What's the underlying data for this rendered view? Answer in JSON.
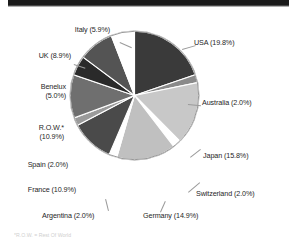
{
  "header": {
    "band_color": "#1a1a1a"
  },
  "footnote": {
    "text": "*R.O.W. = Rest Of World"
  },
  "chart_data": {
    "type": "pie",
    "title": "",
    "subtitle": "",
    "xlabel": "",
    "ylabel": "",
    "grid": false,
    "legend_position": "none",
    "labels_outside": true,
    "start_angle_deg": 0,
    "direction": "clockwise",
    "total_percent": 100.0,
    "categories": [
      "USA",
      "Australia",
      "Japan",
      "Switzerland",
      "Germany",
      "Argentina",
      "France",
      "Spain",
      "R.O.W.*",
      "Benelux",
      "UK",
      "Italy"
    ],
    "values": [
      19.8,
      2.0,
      15.8,
      2.0,
      14.9,
      2.0,
      10.9,
      2.0,
      10.9,
      5.0,
      8.9,
      5.9
    ],
    "slice_colors": [
      "#3a3a3a",
      "#8a8a8a",
      "#c8c8c8",
      "#ffffff",
      "#c0c0c0",
      "#ffffff",
      "#4a4a4a",
      "#9a9a9a",
      "#6f6f6f",
      "#2a2a2a",
      "#545454",
      "#ffffff"
    ],
    "slices": [
      {
        "label": "USA (19.8%)",
        "name": "USA",
        "percent": 19.8,
        "color": "#3a3a3a"
      },
      {
        "label": "Australia (2.0%)",
        "name": "Australia",
        "percent": 2.0,
        "color": "#8a8a8a"
      },
      {
        "label": "Japan (15.8%)",
        "name": "Japan",
        "percent": 15.8,
        "color": "#c8c8c8"
      },
      {
        "label": "Switzerland (2.0%)",
        "name": "Switzerland",
        "percent": 2.0,
        "color": "#ffffff"
      },
      {
        "label": "Germany (14.9%)",
        "name": "Germany",
        "percent": 14.9,
        "color": "#c0c0c0"
      },
      {
        "label": "Argentina (2.0%)",
        "name": "Argentina",
        "percent": 2.0,
        "color": "#ffffff"
      },
      {
        "label": "France (10.9%)",
        "name": "France",
        "percent": 10.9,
        "color": "#4a4a4a"
      },
      {
        "label": "Spain (2.0%)",
        "name": "Spain",
        "percent": 2.0,
        "color": "#9a9a9a"
      },
      {
        "label": "R.O.W.* (10.9%)",
        "name": "R.O.W.*",
        "percent": 10.9,
        "color": "#6f6f6f"
      },
      {
        "label": "Benelux (5.0%)",
        "name": "Benelux",
        "percent": 5.0,
        "color": "#2a2a2a"
      },
      {
        "label": "UK (8.9%)",
        "name": "UK",
        "percent": 8.9,
        "color": "#545454"
      },
      {
        "label": "Italy (5.9%)",
        "name": "Italy",
        "percent": 5.9,
        "color": "#ffffff"
      }
    ]
  },
  "labels": {
    "italy": "Italy (5.9%)",
    "uk": "UK (8.9%)",
    "benelux_line1": "Benelux",
    "benelux_line2": "(5.0%)",
    "row_line1": "R.O.W.*",
    "row_line2": "(10.9%)",
    "spain": "Spain (2.0%)",
    "france": "France (10.9%)",
    "argentina": "Argentina (2.0%)",
    "germany": "Germany (14.9%)",
    "switzerland": "Switzerland (2.0%)",
    "japan": "Japan (15.8%)",
    "australia": "Australia (2.0%)",
    "usa": "USA (19.8%)"
  }
}
